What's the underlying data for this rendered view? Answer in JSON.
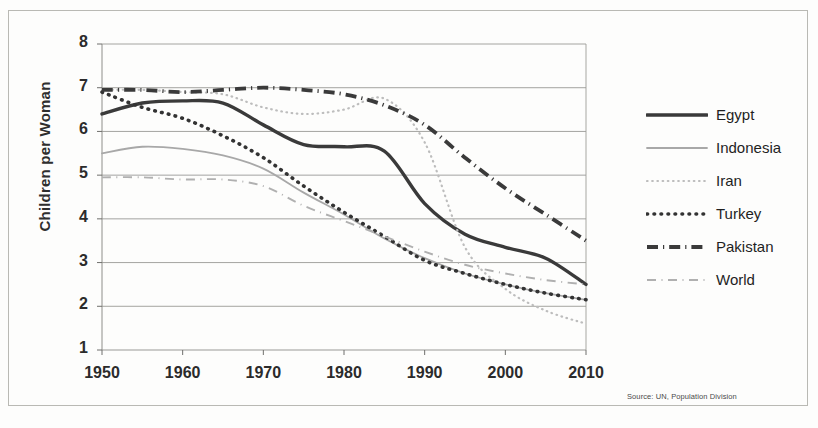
{
  "axes": {
    "y_title": "Children per Woman",
    "y_ticks": [
      "8",
      "7",
      "6",
      "5",
      "4",
      "3",
      "2",
      "1"
    ],
    "x_ticks": [
      "1950",
      "1960",
      "1970",
      "1980",
      "1990",
      "2000",
      "2010"
    ]
  },
  "legend": {
    "items": [
      {
        "label": "Egypt",
        "style": "solid-thick",
        "color": "#3a3a3a"
      },
      {
        "label": "Indonesia",
        "style": "solid-thin",
        "color": "#a8a8a8"
      },
      {
        "label": "Iran",
        "style": "fine-dotted",
        "color": "#bdbdbd"
      },
      {
        "label": "Turkey",
        "style": "bold-dotted",
        "color": "#333333"
      },
      {
        "label": "Pakistan",
        "style": "dash-dot-thick",
        "color": "#3a3a3a"
      },
      {
        "label": "World",
        "style": "dash-dot-thin",
        "color": "#b0b0b0"
      }
    ]
  },
  "source": "Source: UN, Population Division",
  "chart_data": {
    "type": "line",
    "title": "",
    "xlabel": "",
    "ylabel": "Children per Woman",
    "xlim": [
      1950,
      2010
    ],
    "ylim": [
      1,
      8
    ],
    "grid": true,
    "legend_position": "right",
    "x": [
      1950,
      1955,
      1960,
      1965,
      1970,
      1975,
      1980,
      1985,
      1990,
      1995,
      2000,
      2005,
      2010
    ],
    "series": [
      {
        "name": "Egypt",
        "color": "#3a3a3a",
        "style": "solid-thick",
        "values": [
          6.4,
          6.65,
          6.7,
          6.65,
          6.15,
          5.7,
          5.65,
          5.55,
          4.35,
          3.65,
          3.35,
          3.1,
          2.5
        ]
      },
      {
        "name": "Indonesia",
        "color": "#a8a8a8",
        "style": "solid-thin",
        "values": [
          5.5,
          5.65,
          5.6,
          5.45,
          5.15,
          4.6,
          4.1,
          3.55,
          3.1,
          2.75,
          2.5,
          2.3,
          2.15
        ]
      },
      {
        "name": "Iran",
        "color": "#bdbdbd",
        "style": "fine-dotted",
        "values": [
          6.95,
          6.95,
          6.9,
          6.85,
          6.55,
          6.4,
          6.5,
          6.75,
          5.75,
          3.35,
          2.4,
          1.9,
          1.6
        ]
      },
      {
        "name": "Turkey",
        "color": "#333333",
        "style": "bold-dotted",
        "values": [
          6.9,
          6.55,
          6.3,
          5.9,
          5.4,
          4.75,
          4.15,
          3.6,
          3.05,
          2.75,
          2.5,
          2.3,
          2.15
        ]
      },
      {
        "name": "Pakistan",
        "color": "#3a3a3a",
        "style": "dash-dot-thick",
        "values": [
          6.95,
          6.95,
          6.9,
          6.95,
          7.0,
          6.95,
          6.85,
          6.6,
          6.15,
          5.4,
          4.7,
          4.1,
          3.5
        ]
      },
      {
        "name": "World",
        "color": "#b0b0b0",
        "style": "dash-dot-thin",
        "values": [
          4.95,
          4.95,
          4.9,
          4.9,
          4.75,
          4.3,
          3.95,
          3.6,
          3.25,
          2.95,
          2.75,
          2.6,
          2.5
        ]
      }
    ]
  }
}
